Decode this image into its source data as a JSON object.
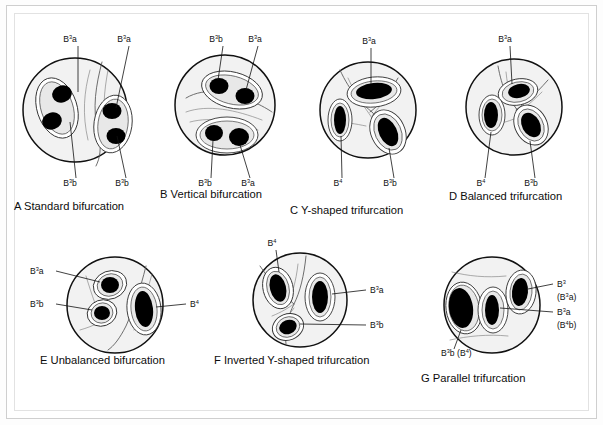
{
  "figure": {
    "background_color": "#ffffff",
    "frame_color": "#cfcfcf",
    "circle_fill": "#f2f2f2",
    "orifice_color": "#000000"
  },
  "panels": [
    {
      "id": "A",
      "letter": "A",
      "caption": "Standard bifurcation",
      "caption_x": 14,
      "caption_y": 210,
      "circles": [
        {
          "cx": 75,
          "cy": 110,
          "r": 52
        }
      ],
      "labels": [
        {
          "text": "B",
          "sup": "3",
          "tail": "a",
          "x": 70,
          "y": 42,
          "anchor": "middle",
          "leader": [
            [
              78,
              46
            ],
            [
              78,
              92
            ]
          ]
        },
        {
          "text": "B",
          "sup": "3",
          "tail": "a",
          "x": 124,
          "y": 42,
          "anchor": "middle",
          "leader": [
            [
              129,
              46
            ],
            [
              116,
              108
            ]
          ]
        },
        {
          "text": "B",
          "sup": "3",
          "tail": "b",
          "x": 70,
          "y": 186,
          "anchor": "middle",
          "leader": [
            [
              76,
              178
            ],
            [
              70,
              122
            ]
          ]
        },
        {
          "text": "B",
          "sup": "3",
          "tail": "b",
          "x": 122,
          "y": 186,
          "anchor": "middle",
          "leader": [
            [
              126,
              178
            ],
            [
              117,
              136
            ]
          ]
        }
      ]
    },
    {
      "id": "B",
      "letter": "B",
      "caption": "Vertical bifurcation",
      "caption_x": 160,
      "caption_y": 198,
      "circles": [
        {
          "cx": 225,
          "cy": 105,
          "r": 50
        }
      ],
      "labels": [
        {
          "text": "B",
          "sup": "3",
          "tail": "b",
          "x": 216,
          "y": 42,
          "anchor": "middle",
          "leader": [
            [
              223,
              46
            ],
            [
              218,
              87
            ]
          ]
        },
        {
          "text": "B",
          "sup": "3",
          "tail": "a",
          "x": 255,
          "y": 42,
          "anchor": "middle",
          "leader": [
            [
              258,
              46
            ],
            [
              245,
              98
            ]
          ]
        },
        {
          "text": "B",
          "sup": "3",
          "tail": "b",
          "x": 205,
          "y": 186,
          "anchor": "middle",
          "leader": [
            [
              211,
              178
            ],
            [
              212,
              135
            ]
          ]
        },
        {
          "text": "B",
          "sup": "3",
          "tail": "a",
          "x": 248,
          "y": 186,
          "anchor": "middle",
          "leader": [
            [
              250,
              178
            ],
            [
              238,
              140
            ]
          ]
        }
      ]
    },
    {
      "id": "C",
      "letter": "C",
      "caption": "Y-shaped trifurcation",
      "caption_x": 290,
      "caption_y": 214,
      "circles": [
        {
          "cx": 368,
          "cy": 110,
          "r": 48
        }
      ],
      "labels": [
        {
          "text": "B",
          "sup": "3",
          "tail": "a",
          "x": 369,
          "y": 44,
          "anchor": "middle",
          "leader": [
            [
              371,
              48
            ],
            [
              371,
              84
            ]
          ]
        },
        {
          "text": "B",
          "sup": "4",
          "tail": "",
          "x": 338,
          "y": 186,
          "anchor": "middle",
          "leader": [
            [
              342,
              178
            ],
            [
              341,
              122
            ]
          ]
        },
        {
          "text": "B",
          "sup": "3",
          "tail": "b",
          "x": 390,
          "y": 186,
          "anchor": "middle",
          "leader": [
            [
              394,
              178
            ],
            [
              387,
              132
            ]
          ]
        }
      ]
    },
    {
      "id": "D",
      "letter": "D",
      "caption": "Balanced trifurcation",
      "caption_x": 449,
      "caption_y": 200,
      "circles": [
        {
          "cx": 514,
          "cy": 107,
          "r": 48
        }
      ],
      "labels": [
        {
          "text": "B",
          "sup": "3",
          "tail": "a",
          "x": 505,
          "y": 42,
          "anchor": "middle",
          "leader": [
            [
              510,
              46
            ],
            [
              512,
              88
            ]
          ]
        },
        {
          "text": "B",
          "sup": "4",
          "tail": "",
          "x": 481,
          "y": 186,
          "anchor": "middle",
          "leader": [
            [
              485,
              178
            ],
            [
              491,
              122
            ]
          ]
        },
        {
          "text": "B",
          "sup": "3",
          "tail": "b",
          "x": 531,
          "y": 186,
          "anchor": "middle",
          "leader": [
            [
              535,
              178
            ],
            [
              529,
              131
            ]
          ]
        }
      ]
    },
    {
      "id": "E",
      "letter": "E",
      "caption": "Unbalanced bifurcation",
      "caption_x": 40,
      "caption_y": 364,
      "circles": [
        {
          "cx": 115,
          "cy": 305,
          "r": 48
        }
      ],
      "labels": [
        {
          "text": "B",
          "sup": "3",
          "tail": "a",
          "x": 30,
          "y": 274,
          "anchor": "start",
          "leader": [
            [
              56,
              271
            ],
            [
              100,
              285
            ]
          ]
        },
        {
          "text": "B",
          "sup": "3",
          "tail": "b",
          "x": 30,
          "y": 307,
          "anchor": "start",
          "leader": [
            [
              56,
              304
            ],
            [
              95,
              310
            ]
          ]
        },
        {
          "text": "B",
          "sup": "4",
          "tail": "",
          "x": 190,
          "y": 307,
          "anchor": "start",
          "leader": [
            [
              186,
              304
            ],
            [
              140,
              308
            ]
          ]
        }
      ]
    },
    {
      "id": "F",
      "letter": "F",
      "caption": "Inverted Y-shaped trifurcation",
      "caption_x": 214,
      "caption_y": 364,
      "circles": [
        {
          "cx": 300,
          "cy": 300,
          "r": 47
        }
      ],
      "labels": [
        {
          "text": "B",
          "sup": "4",
          "tail": "",
          "x": 272,
          "y": 246,
          "anchor": "middle",
          "leader": [
            [
              276,
              250
            ],
            [
              280,
              282
            ]
          ]
        },
        {
          "text": "B",
          "sup": "3",
          "tail": "a",
          "x": 370,
          "y": 293,
          "anchor": "start",
          "leader": [
            [
              366,
              290
            ],
            [
              325,
              296
            ]
          ]
        },
        {
          "text": "B",
          "sup": "3",
          "tail": "b",
          "x": 370,
          "y": 328,
          "anchor": "start",
          "leader": [
            [
              366,
              325
            ],
            [
              297,
              322
            ]
          ]
        }
      ]
    },
    {
      "id": "G",
      "letter": "G",
      "caption": "Parallel trifurcation",
      "caption_x": 421,
      "caption_y": 382,
      "circles": [
        {
          "cx": 492,
          "cy": 305,
          "r": 48
        }
      ],
      "labels": [
        {
          "text": "B",
          "sup": "3",
          "tail": "",
          "x": 557,
          "y": 287,
          "anchor": "start",
          "leader": [
            [
              553,
              284
            ],
            [
              512,
              292
            ]
          ]
        },
        {
          "text": "(B",
          "sup": "3",
          "tail": "a)",
          "x": 557,
          "y": 300,
          "anchor": "start",
          "leader": null
        },
        {
          "text": "B",
          "sup": "3",
          "tail": "a",
          "x": 557,
          "y": 315,
          "anchor": "start",
          "leader": [
            [
              553,
              312
            ],
            [
              489,
              308
            ]
          ]
        },
        {
          "text": "(B",
          "sup": "4",
          "tail": "b)",
          "x": 557,
          "y": 328,
          "anchor": "start",
          "leader": null
        },
        {
          "text": "B",
          "sup": "3",
          "tail": "b (B",
          "sup2": "4",
          "tail2": ")",
          "x": 441,
          "y": 356,
          "anchor": "start",
          "leader": [
            [
              454,
              349
            ],
            [
              461,
              320
            ]
          ]
        }
      ]
    }
  ],
  "all_labels_flat": [
    "B3a",
    "B3a",
    "B3b",
    "B3b",
    "B3b",
    "B3a",
    "B3b",
    "B3a",
    "B3a",
    "B4",
    "B3b",
    "B3a",
    "B4",
    "B3b",
    "B3a",
    "B3b",
    "B4",
    "B4",
    "B3a",
    "B3b",
    "B3",
    "(B3a)",
    "B3a",
    "(B4b)",
    "B3b (B4)"
  ],
  "captions": [
    "A  Standard bifurcation",
    "B  Vertical bifurcation",
    "C  Y-shaped trifurcation",
    "D  Balanced trifurcation",
    "E  Unbalanced bifurcation",
    "F  Inverted Y-shaped trifurcation",
    "G  Parallel trifurcation"
  ]
}
